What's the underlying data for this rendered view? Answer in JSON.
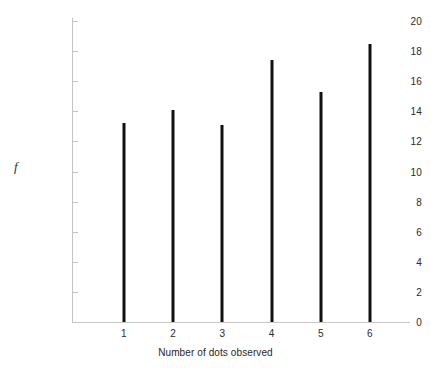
{
  "chart_data": {
    "type": "bar",
    "title": "",
    "xlabel": "Number of dots observed",
    "ylabel": "f",
    "categories": [
      "1",
      "2",
      "3",
      "4",
      "5",
      "6"
    ],
    "values": [
      13.2,
      14.1,
      13.1,
      17.4,
      15.3,
      18.5
    ],
    "ylim": [
      0,
      20
    ],
    "ytick_values": [
      0,
      2,
      4,
      6,
      8,
      10,
      12,
      14,
      16,
      18,
      20
    ],
    "ytick_labels": [
      "0",
      "2",
      "4",
      "6",
      "8",
      "10",
      "12",
      "14",
      "16",
      "18",
      "20"
    ],
    "grid": false,
    "legend": false,
    "bar_color": "#111111",
    "axis_color": "#c3c3c3",
    "background_color": "#ffffff"
  }
}
